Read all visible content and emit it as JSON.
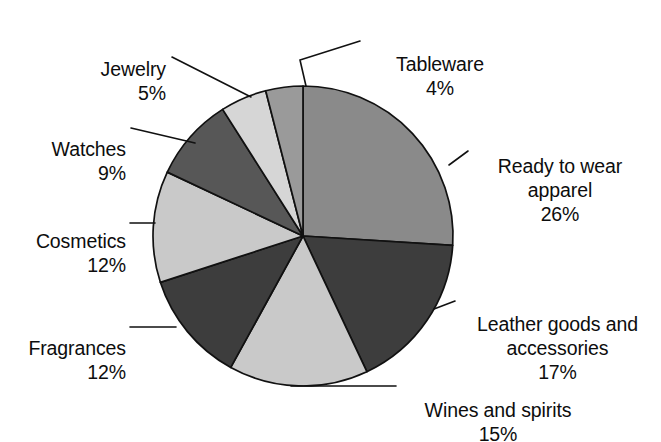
{
  "chart_data": {
    "type": "pie",
    "title": "",
    "subtitle": "",
    "xlabel": "",
    "ylabel": "",
    "legend_position": "none",
    "grid": false,
    "value_unit": "%",
    "start_angle_deg": 0,
    "direction": "clockwise",
    "categories": [
      "Ready to wear apparel",
      "Leather goods and accessories",
      "Wines and spirits",
      "Fragrances",
      "Cosmetics",
      "Watches",
      "Jewelry",
      "Tableware"
    ],
    "values": [
      26,
      17,
      15,
      12,
      12,
      9,
      5,
      4
    ],
    "slices": [
      {
        "name": "Ready to wear apparel",
        "label": "Ready to wear\napparel",
        "value": 26,
        "pct_text": "26%",
        "color": "#8a8a8a"
      },
      {
        "name": "Leather goods and accessories",
        "label": "Leather goods and\naccessories",
        "value": 17,
        "pct_text": "17%",
        "color": "#3d3d3d"
      },
      {
        "name": "Wines and spirits",
        "label": "Wines and spirits",
        "value": 15,
        "pct_text": "15%",
        "color": "#c9c9c9"
      },
      {
        "name": "Fragrances",
        "label": "Fragrances",
        "value": 12,
        "pct_text": "12%",
        "color": "#3d3d3d"
      },
      {
        "name": "Cosmetics",
        "label": "Cosmetics",
        "value": 12,
        "pct_text": "12%",
        "color": "#c9c9c9"
      },
      {
        "name": "Watches",
        "label": "Watches",
        "value": 9,
        "pct_text": "9%",
        "color": "#575757"
      },
      {
        "name": "Jewelry",
        "label": "Jewelry",
        "value": 5,
        "pct_text": "5%",
        "color": "#d6d6d6"
      },
      {
        "name": "Tableware",
        "label": "Tableware",
        "value": 4,
        "pct_text": "4%",
        "color": "#9a9a9a"
      }
    ],
    "colors": {
      "slice_stroke": "#111111",
      "leader_line": "#111111",
      "background": "#ffffff",
      "text": "#0d0d0d"
    }
  },
  "labels": {
    "tableware": {
      "name": "Tableware",
      "pct": "4%"
    },
    "ready": {
      "name": "Ready to wear\napparel",
      "pct": "26%"
    },
    "leather": {
      "name": "Leather goods and\naccessories",
      "pct": "17%"
    },
    "wines": {
      "name": "Wines and spirits",
      "pct": "15%"
    },
    "fragrances": {
      "name": "Fragrances",
      "pct": "12%"
    },
    "cosmetics": {
      "name": "Cosmetics",
      "pct": "12%"
    },
    "watches": {
      "name": "Watches",
      "pct": "9%"
    },
    "jewelry": {
      "name": "Jewelry",
      "pct": "5%"
    }
  }
}
